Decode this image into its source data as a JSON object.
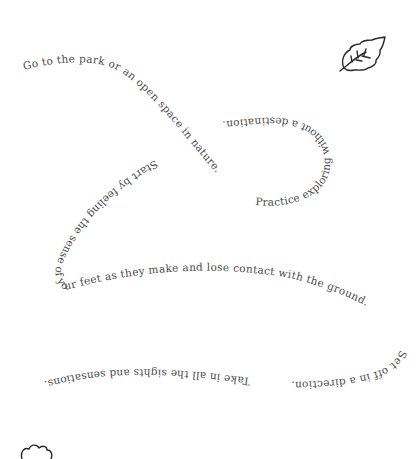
{
  "page": {
    "background": "#ffffff",
    "text_color": "#4a4a4a"
  },
  "path_text": {
    "segment_1": "Go to the park or an open space in nature.",
    "segment_2": "Practice exploring without a destination.",
    "segment_3": "Start by feeling the sense of your feet as they make and lose contact with the ground.",
    "segment_4": "Set off in a direction.",
    "segment_5": "Take in all the sights and sensations."
  },
  "icons": {
    "top_right": "leaf-icon",
    "bottom_left": "cloud-doodle-icon"
  }
}
